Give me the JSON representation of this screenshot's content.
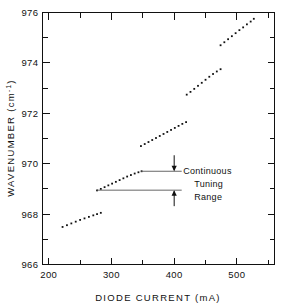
{
  "figure": {
    "background_color": "#ffffff",
    "ink_color": "#111111"
  },
  "chart_data": {
    "type": "scatter",
    "title": "",
    "xlabel": "DIODE CURRENT (mA)",
    "ylabel": "WAVENUMBER (cm",
    "ylabel_superscript": "-1",
    "ylabel_suffix": ")",
    "xlim": [
      190,
      560
    ],
    "ylim": [
      966,
      976
    ],
    "grid": false,
    "legend": "none",
    "x_major_ticks": [
      200,
      300,
      400,
      500
    ],
    "x_major_tick_labels": [
      "200",
      "300",
      "400",
      "500"
    ],
    "x_minor_ticks": [
      250,
      350,
      450,
      550
    ],
    "y_major_ticks": [
      966,
      968,
      970,
      972,
      974,
      976
    ],
    "y_major_tick_labels": [
      "966",
      "968",
      "970",
      "972",
      "974",
      "976"
    ],
    "y_minor_ticks": [
      967,
      969,
      971,
      973,
      975
    ],
    "series": [
      {
        "name": "mode-1",
        "x": [
          222,
          229,
          236,
          243,
          250,
          257,
          264,
          271,
          277,
          283
        ],
        "y": [
          967.49,
          967.56,
          967.63,
          967.7,
          967.77,
          967.83,
          967.89,
          967.95,
          968.0,
          968.05
        ]
      },
      {
        "name": "mode-2",
        "x": [
          277,
          283,
          289,
          295,
          301,
          307,
          313,
          319,
          325,
          331,
          337,
          343,
          348
        ],
        "y": [
          968.94,
          969.0,
          969.07,
          969.14,
          969.21,
          969.28,
          969.35,
          969.42,
          969.49,
          969.55,
          969.61,
          969.66,
          969.7
        ]
      },
      {
        "name": "mode-3",
        "x": [
          347,
          353,
          359,
          365,
          371,
          377,
          383,
          389,
          395,
          401,
          407,
          413,
          419
        ],
        "y": [
          970.7,
          970.78,
          970.86,
          970.94,
          971.02,
          971.1,
          971.18,
          971.26,
          971.34,
          971.42,
          971.5,
          971.58,
          971.65
        ]
      },
      {
        "name": "mode-4",
        "x": [
          420,
          426,
          432,
          438,
          444,
          450,
          456,
          462,
          468,
          474
        ],
        "y": [
          972.74,
          972.85,
          972.97,
          973.09,
          973.21,
          973.33,
          973.45,
          973.56,
          973.66,
          973.75
        ]
      },
      {
        "name": "mode-5",
        "x": [
          474,
          480,
          486,
          492,
          498,
          504,
          510,
          516,
          522,
          527
        ],
        "y": [
          974.7,
          974.82,
          974.94,
          975.06,
          975.18,
          975.3,
          975.41,
          975.53,
          975.64,
          975.75
        ]
      }
    ],
    "annotations": [
      {
        "name": "continuous-tuning-range",
        "lines": [
          "Continuous",
          "Tuning",
          "Range"
        ],
        "marker_top_value": 969.7,
        "marker_bottom_value": 968.95,
        "marker_x_value": 400,
        "guide_top_x_start": 347,
        "guide_top_x_end": 412,
        "guide_bottom_x_start": 277,
        "guide_bottom_x_end": 412
      }
    ]
  }
}
